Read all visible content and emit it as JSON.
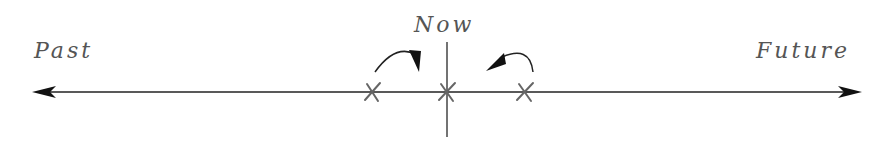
{
  "diagram": {
    "type": "timeline",
    "labels": {
      "past": "Past",
      "now": "Now",
      "future": "Future"
    },
    "markers": [
      {
        "id": "past-marker",
        "glyph": "x",
        "position": "left-of-now"
      },
      {
        "id": "now-marker",
        "glyph": "x",
        "position": "now"
      },
      {
        "id": "future-marker",
        "glyph": "x",
        "position": "right-of-now"
      }
    ],
    "arrows": [
      {
        "id": "past-to-now-arrow",
        "direction": "toward-now-from-left"
      },
      {
        "id": "future-to-now-arrow",
        "direction": "toward-now-from-right"
      }
    ],
    "colors": {
      "line": "#222222",
      "text": "#555555",
      "marks": "#666666"
    }
  }
}
